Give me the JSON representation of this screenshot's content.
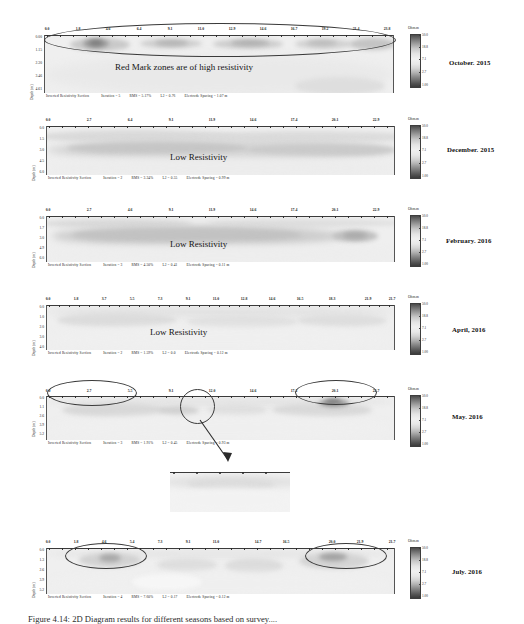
{
  "figure": {
    "caption": "Figure 4.14: 2D Diagram results for different seasons based on survey....",
    "colorbar_unit": "Ohm.m",
    "colorbar_ticks": [
      "50.0",
      "18.8",
      "7.1",
      "2.7",
      "1.00"
    ],
    "y_axis_label": "Depth (m)"
  },
  "panels": [
    {
      "id": "october-2015",
      "date_label": "October. 2015",
      "x_ticks": [
        "0.0",
        "1.8",
        "4.6",
        "6.4",
        "9.1",
        "11.0",
        "12.9",
        "14.6",
        "16.7",
        "19.2",
        "21.4",
        "23.8"
      ],
      "y_ticks": [
        "0.00",
        "1.15",
        "2.30",
        "3.46",
        "4.61"
      ],
      "caption_parts": [
        "Inverted Resistivity Section",
        "Iteration = 5",
        "RMS = 5.17%",
        "L2 = 0.76",
        "Electrode Spacing = 1.07 m"
      ],
      "annotation": "Red Mark zones are of high resistivity",
      "has_ellipse": true
    },
    {
      "id": "december-2015",
      "date_label": "December. 2015",
      "x_ticks": [
        "0.0",
        "2.7",
        "6.4",
        "9.1",
        "11.9",
        "14.6",
        "17.4",
        "20.1",
        "22.9"
      ],
      "y_ticks": [
        "0.0",
        "1.5",
        "3.0",
        "4.5",
        "6.0"
      ],
      "caption_parts": [
        "Inverted Resistivity Section",
        "Iteration = 2",
        "RMS = 3.34%",
        "L2 = 0.55",
        "Electrode Spacing = 0.99 m"
      ],
      "annotation": "Low Resistivity",
      "has_ellipse": false
    },
    {
      "id": "february-2016",
      "date_label": "February. 2016",
      "x_ticks": [
        "0.0",
        "2.7",
        "4.6",
        "9.1",
        "11.9",
        "14.6",
        "17.4",
        "20.1",
        "22.9"
      ],
      "y_ticks": [
        "0.0",
        "1.7",
        "3.0",
        "4.9",
        "6.0"
      ],
      "caption_parts": [
        "Inverted Resistivity Section",
        "Iteration = 3",
        "RMS = 4.50%",
        "L2 = 0.41",
        "Electrode Spacing = 0.11 m"
      ],
      "annotation": "Low Resistivity",
      "has_ellipse": false
    },
    {
      "id": "april-2016",
      "date_label": "April, 2016",
      "x_ticks": [
        "0.0",
        "1.8",
        "3.7",
        "5.5",
        "7.3",
        "9.1",
        "11.0",
        "12.8",
        "14.6",
        "16.5",
        "18.3",
        "21.9",
        "21.7"
      ],
      "y_ticks": [
        "0.0",
        "1.0",
        "2.0",
        "3.0",
        "4.0"
      ],
      "caption_parts": [
        "Inverted Resistivity Section",
        "Iteration = 2",
        "RMS = 1.59%",
        "L2 = 0.0",
        "Electrode Spacing = 0.12 m"
      ],
      "annotation": "Low Resistivity",
      "has_ellipse": false
    },
    {
      "id": "may-2016",
      "date_label": "May. 2016",
      "x_ticks": [
        "0.0",
        "2.7",
        "5.5",
        "9.1",
        "12.0",
        "14.6",
        "17.2",
        "20.1",
        "22.7"
      ],
      "y_ticks": [
        "0.0",
        "1.1",
        "2.6",
        "3.9",
        "5.2"
      ],
      "caption_parts": [
        "Inverted Resistivity Section",
        "Iteration = 3",
        "RMS = 1.91%",
        "L2 = 0.45",
        "Electrode Spacing = 0.93 m"
      ],
      "annotation": "",
      "has_ellipse": true
    },
    {
      "id": "inset-zoom",
      "date_label": "",
      "x_ticks": [],
      "y_ticks": [],
      "caption_parts": [],
      "annotation": "",
      "has_ellipse": false
    },
    {
      "id": "july-2016",
      "date_label": "July. 2016",
      "x_ticks": [
        "0.0",
        "1.8",
        "4.6",
        "5.4",
        "7.3",
        "9.1",
        "11.0",
        "14.7",
        "16.5",
        "20.0",
        "21.9",
        "21.7"
      ],
      "y_ticks": [
        "0.0",
        "1.3",
        "2.6",
        "3.9",
        "5.2"
      ],
      "caption_parts": [
        "Inverted Resistivity Section",
        "Iteration = 4",
        "RMS = 7.60%",
        "L2 = 0.17",
        "Electrode Spacing = 0.12 m"
      ],
      "annotation": "",
      "has_ellipse": true
    }
  ]
}
